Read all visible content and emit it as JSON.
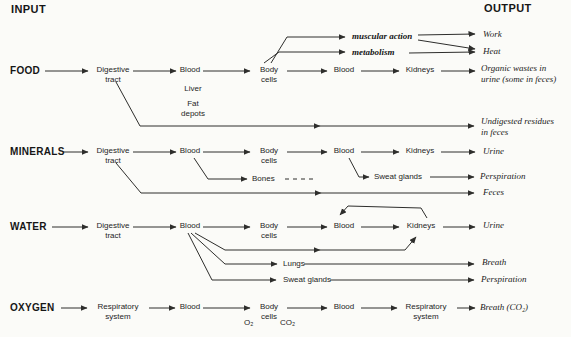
{
  "header": {
    "input": "INPUT",
    "output": "OUTPUT"
  },
  "food_row": {
    "source": "FOOD",
    "digestive_tract": "Digestive\ntract",
    "blood_1": "Blood",
    "liver": "Liver",
    "fat_depots": "Fat\ndepots",
    "body_cells": "Body\ncells",
    "muscular_action": "muscular action",
    "metabolism": "metabolism",
    "blood_2": "Blood",
    "kidneys": "Kidneys",
    "work": "Work",
    "heat": "Heat",
    "organic_wastes": "Organic wastes in\nurine (some in feces)",
    "undigested_residues": "Undigested residues\nin feces"
  },
  "minerals_row": {
    "source": "MINERALS",
    "digestive_tract": "Digestive\ntract",
    "blood_1": "Blood",
    "body_cells": "Body\ncells",
    "bones": "Bones",
    "blood_2": "Blood",
    "kidneys": "Kidneys",
    "sweat_glands": "Sweat glands",
    "urine": "Urine",
    "perspiration": "Perspiration",
    "feces": "Feces"
  },
  "water_row": {
    "source": "WATER",
    "digestive_tract": "Digestive\ntract",
    "blood_1": "Blood",
    "body_cells": "Body\ncells",
    "blood_2": "Blood",
    "kidneys": "Kidneys",
    "urine": "Urine",
    "lungs": "Lungs",
    "breath": "Breath",
    "sweat_glands": "Sweat glands",
    "perspiration": "Perspiration"
  },
  "oxygen_row": {
    "source": "OXYGEN",
    "respiratory_system_1": "Respiratory\nsystem",
    "blood_1": "Blood",
    "body_cells": "Body\ncells",
    "o2": "O₂",
    "co2": "CO₂",
    "blood_2": "Blood",
    "respiratory_system_2": "Respiratory\nsystem",
    "breath_co2": "Breath (CO₂)"
  },
  "colors": {
    "ink": "#2e2e2c",
    "background": "#fbfbf8"
  }
}
